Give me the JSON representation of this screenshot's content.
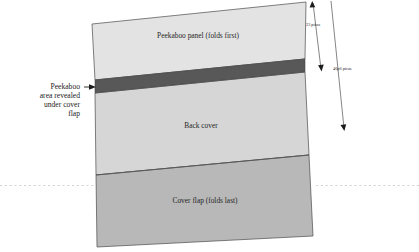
{
  "figure": {
    "panels": [
      {
        "id": "peekaboo-panel",
        "label": "Peekaboo panel (folds first)",
        "color": "#e3e3e3"
      },
      {
        "id": "peekaboo-reveal-band",
        "label": "",
        "color": "#585858"
      },
      {
        "id": "back-cover",
        "label": "Back cover",
        "color": "#d6d6d6"
      },
      {
        "id": "cover-flap",
        "label": "Cover flap (folds last)",
        "color": "#b8b8b8"
      }
    ],
    "callout": {
      "lines": [
        "Peekaboo",
        "area revealed",
        "under cover",
        "flap"
      ]
    },
    "dimensions": [
      {
        "id": "dimension-23-picas",
        "label": "23 picas"
      },
      {
        "id": "dimension-46p6-picas",
        "label": "46p6 picas"
      }
    ]
  }
}
